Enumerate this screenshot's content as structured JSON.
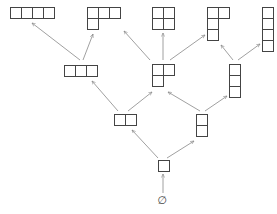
{
  "diagram": {
    "title": "",
    "cell_size": 11,
    "colors": {
      "stroke": "#444444",
      "edge": "#888888",
      "background": "#ffffff"
    },
    "empty_label": "∅",
    "nodes": [
      {
        "id": "empty",
        "partition": [],
        "x": 162,
        "y": 200
      },
      {
        "id": "p1",
        "partition": [
          1
        ],
        "x": 158,
        "y": 160
      },
      {
        "id": "p2",
        "partition": [
          2
        ],
        "x": 114,
        "y": 114
      },
      {
        "id": "p11",
        "partition": [
          1,
          1
        ],
        "x": 196,
        "y": 114
      },
      {
        "id": "p3",
        "partition": [
          3
        ],
        "x": 64,
        "y": 65
      },
      {
        "id": "p21",
        "partition": [
          2,
          1
        ],
        "x": 152,
        "y": 64
      },
      {
        "id": "p111",
        "partition": [
          1,
          1,
          1
        ],
        "x": 229,
        "y": 64
      },
      {
        "id": "p4",
        "partition": [
          4
        ],
        "x": 10,
        "y": 7
      },
      {
        "id": "p31",
        "partition": [
          3,
          1
        ],
        "x": 87,
        "y": 7
      },
      {
        "id": "p22",
        "partition": [
          2,
          2
        ],
        "x": 152,
        "y": 7
      },
      {
        "id": "p211",
        "partition": [
          2,
          1,
          1
        ],
        "x": 207,
        "y": 7
      },
      {
        "id": "p1111",
        "partition": [
          1,
          1,
          1,
          1
        ],
        "x": 262,
        "y": 7
      }
    ],
    "edges": [
      {
        "from": "empty",
        "to": "p1",
        "x1": 163,
        "y1": 193,
        "x2": 163,
        "y2": 174
      },
      {
        "from": "p1",
        "to": "p2",
        "x1": 158,
        "y1": 158,
        "x2": 132,
        "y2": 130
      },
      {
        "from": "p1",
        "to": "p11",
        "x1": 167,
        "y1": 158,
        "x2": 194,
        "y2": 141
      },
      {
        "from": "p2",
        "to": "p3",
        "x1": 118,
        "y1": 111,
        "x2": 92,
        "y2": 81
      },
      {
        "from": "p2",
        "to": "p21",
        "x1": 128,
        "y1": 111,
        "x2": 152,
        "y2": 92
      },
      {
        "from": "p11",
        "to": "p21",
        "x1": 200,
        "y1": 111,
        "x2": 168,
        "y2": 92
      },
      {
        "from": "p11",
        "to": "p111",
        "x1": 205,
        "y1": 111,
        "x2": 227,
        "y2": 96
      },
      {
        "from": "p3",
        "to": "p4",
        "x1": 80,
        "y1": 60,
        "x2": 32,
        "y2": 23
      },
      {
        "from": "p3",
        "to": "p31",
        "x1": 83,
        "y1": 60,
        "x2": 93,
        "y2": 34
      },
      {
        "from": "p21",
        "to": "p31",
        "x1": 150,
        "y1": 60,
        "x2": 124,
        "y2": 31
      },
      {
        "from": "p21",
        "to": "p22",
        "x1": 163,
        "y1": 60,
        "x2": 163,
        "y2": 33
      },
      {
        "from": "p21",
        "to": "p211",
        "x1": 170,
        "y1": 60,
        "x2": 205,
        "y2": 35
      },
      {
        "from": "p111",
        "to": "p211",
        "x1": 233,
        "y1": 60,
        "x2": 221,
        "y2": 45
      },
      {
        "from": "p111",
        "to": "p1111",
        "x1": 238,
        "y1": 60,
        "x2": 260,
        "y2": 44
      }
    ]
  }
}
